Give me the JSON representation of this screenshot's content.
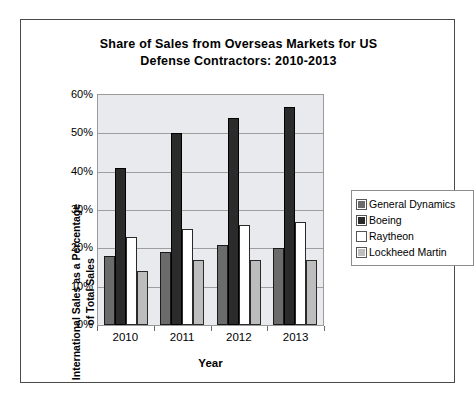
{
  "chart_data": {
    "type": "bar",
    "title": "Share of Sales from Overseas Markets for US Defense Contractors: 2010-2013",
    "title_line1": "Share of Sales from Overseas Markets for US",
    "title_line2": "Defense Contractors: 2010-2013",
    "xlabel": "Year",
    "ylabel": "International Sales as a Percentage of Total Sales",
    "ylabel_line1": "International Sales as a Percentage",
    "ylabel_line2": "of Total Sales",
    "categories": [
      "2010",
      "2011",
      "2012",
      "2013"
    ],
    "ylim": [
      0,
      60
    ],
    "ytick_labels": [
      "60%",
      "50%",
      "40%",
      "30%",
      "20%",
      "10%",
      "0%"
    ],
    "ytick_values": [
      60,
      50,
      40,
      30,
      20,
      10,
      0
    ],
    "grid": true,
    "legend_position": "right",
    "series": [
      {
        "name": "General Dynamics",
        "color": "#6b6b6b",
        "values": [
          18,
          19,
          21,
          20
        ]
      },
      {
        "name": "Boeing",
        "color": "#2b2b2b",
        "values": [
          41,
          50,
          54,
          57
        ]
      },
      {
        "name": "Raytheon",
        "color": "#ffffff",
        "values": [
          23,
          25,
          26,
          27
        ]
      },
      {
        "name": "Lockheed Martin",
        "color": "#bdbdbd",
        "values": [
          14,
          17,
          17,
          17
        ]
      }
    ]
  }
}
